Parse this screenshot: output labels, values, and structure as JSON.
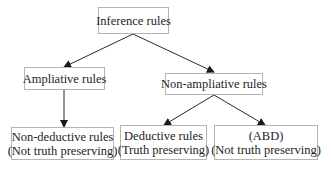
{
  "diagram": {
    "type": "tree",
    "nodes": [
      {
        "id": "inference",
        "lines": [
          "Inference rules"
        ],
        "box": {
          "x": 98,
          "y": 7,
          "w": 71,
          "h": 27
        }
      },
      {
        "id": "ampliative",
        "lines": [
          "Ampliative rules"
        ],
        "box": {
          "x": 24,
          "y": 67,
          "w": 81,
          "h": 23
        }
      },
      {
        "id": "non_ampliative",
        "lines": [
          "Non-ampliative rules"
        ],
        "box": {
          "x": 165,
          "y": 73,
          "w": 98,
          "h": 22
        }
      },
      {
        "id": "non_deductive",
        "lines": [
          "Non-deductive rules",
          "(Not truth preserving)"
        ],
        "box": {
          "x": 11,
          "y": 127,
          "w": 103,
          "h": 33
        }
      },
      {
        "id": "deductive",
        "lines": [
          "Deductive rules",
          "(Truth preserving)"
        ],
        "box": {
          "x": 120,
          "y": 125,
          "w": 87,
          "h": 35
        }
      },
      {
        "id": "abd",
        "lines": [
          "(ABD)",
          "(Not truth preserving)"
        ],
        "box": {
          "x": 214,
          "y": 125,
          "w": 104,
          "h": 35
        }
      }
    ],
    "edges": [
      {
        "from": "inference",
        "to": "ampliative",
        "x1": 133,
        "y1": 34,
        "x2": 64,
        "y2": 67
      },
      {
        "from": "inference",
        "to": "non_ampliative",
        "x1": 133,
        "y1": 34,
        "x2": 214,
        "y2": 72
      },
      {
        "from": "ampliative",
        "to": "non_deductive",
        "x1": 64,
        "y1": 90,
        "x2": 64,
        "y2": 127
      },
      {
        "from": "non_ampliative",
        "to": "deductive",
        "x1": 214,
        "y1": 95,
        "x2": 164,
        "y2": 125
      },
      {
        "from": "non_ampliative",
        "to": "abd",
        "x1": 214,
        "y1": 95,
        "x2": 265,
        "y2": 125
      }
    ],
    "colors": {
      "border": "#b4b4b4",
      "text": "#1e1e1e",
      "edge": "#2a2a2a",
      "background": "#ffffff"
    }
  }
}
